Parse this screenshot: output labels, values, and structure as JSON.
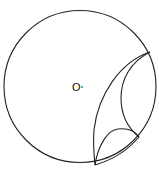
{
  "diagram": {
    "type": "geometry",
    "center_label": "O",
    "stroke_color": "#222222",
    "background": "#ffffff",
    "outer_circle": {
      "cx": 80,
      "cy": 86.5,
      "r": 76
    },
    "points": {
      "upper_right": [
        150,
        52
      ],
      "bottom": [
        95,
        165
      ],
      "inner_junction": [
        139,
        137
      ]
    }
  }
}
